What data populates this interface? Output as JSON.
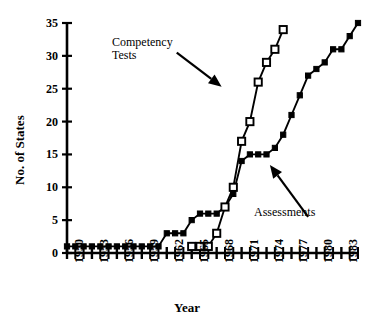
{
  "chart_data": {
    "type": "line",
    "title": "",
    "xlabel": "Year",
    "ylabel": "No. of States",
    "xlim": [
      1950,
      1985
    ],
    "ylim": [
      0,
      35
    ],
    "yticks": [
      0,
      5,
      10,
      15,
      20,
      25,
      30,
      35
    ],
    "ytick_labels": [
      "0",
      "5",
      "10",
      "15",
      "20",
      "25",
      "30",
      "35"
    ],
    "xticks": [
      1950,
      1953,
      1956,
      1959,
      1962,
      1965,
      1968,
      1971,
      1974,
      1977,
      1980,
      1983
    ],
    "xtick_labels": [
      "1950",
      "1953",
      "1956",
      "1959",
      "1962",
      "1965",
      "1968",
      "1971",
      "1974",
      "1977",
      "1980",
      "1983"
    ],
    "xtick_minor_step": 1,
    "grid": false,
    "legend": "annotations",
    "series": [
      {
        "name": "Assessments",
        "marker": "filled-square",
        "color": "#000000",
        "x": [
          1950,
          1951,
          1952,
          1953,
          1954,
          1955,
          1956,
          1957,
          1958,
          1959,
          1960,
          1961,
          1962,
          1963,
          1964,
          1965,
          1966,
          1967,
          1968,
          1969,
          1970,
          1971,
          1972,
          1973,
          1974,
          1975,
          1976,
          1977,
          1978,
          1979,
          1980,
          1981,
          1982,
          1983,
          1984,
          1985
        ],
        "values": [
          1,
          1,
          1,
          1,
          1,
          1,
          1,
          1,
          1,
          1,
          1,
          1,
          3,
          3,
          3,
          5,
          6,
          6,
          6,
          7,
          9,
          14,
          15,
          15,
          15,
          16,
          18,
          21,
          24,
          27,
          28,
          29,
          31,
          31,
          33,
          35
        ]
      },
      {
        "name": "Competency Tests",
        "marker": "open-square",
        "color": "#000000",
        "x": [
          1965,
          1966,
          1967,
          1968,
          1969,
          1970,
          1971,
          1972,
          1973,
          1974,
          1975,
          1976
        ],
        "values": [
          1,
          1,
          1,
          3,
          7,
          10,
          17,
          20,
          26,
          29,
          31,
          34
        ]
      }
    ],
    "annotations": [
      {
        "name": "Competency Tests",
        "text_line1": "Competency",
        "text_line2": "Tests",
        "arrow_from": [
          1963.2,
          30.5
        ],
        "arrow_to": [
          1968.6,
          25.3
        ]
      },
      {
        "name": "Assessments",
        "text_line1": "Assessments",
        "text_line2": "",
        "arrow_from": [
          1979.0,
          5.5
        ],
        "arrow_to": [
          1974.4,
          13.4
        ]
      }
    ]
  }
}
